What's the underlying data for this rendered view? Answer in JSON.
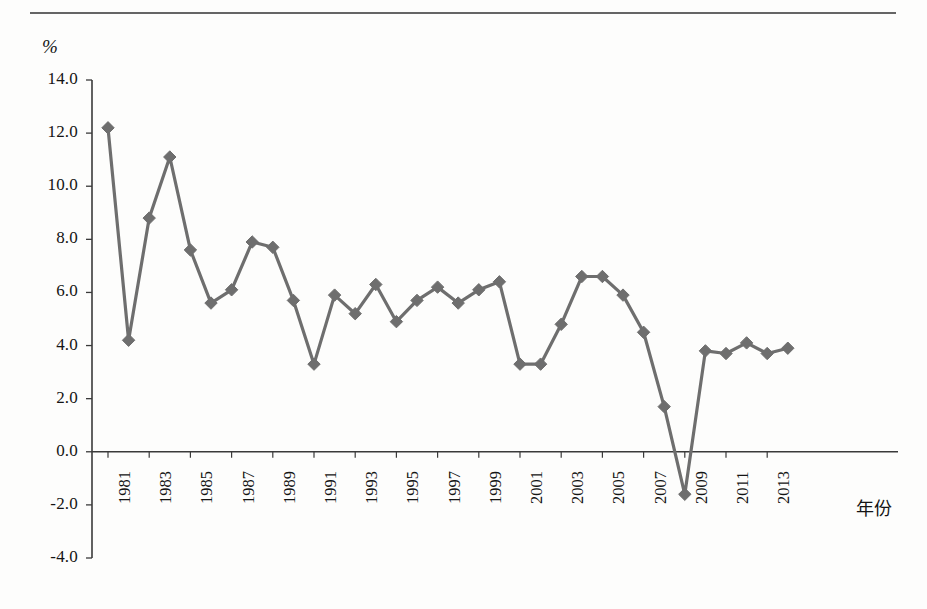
{
  "figure": {
    "y_axis_unit_label": "%",
    "x_axis_title": "年份",
    "axis_color": "#3a3a3a",
    "series_color": "#6e6e6e",
    "background": "#fdfdfc"
  },
  "chart_data": {
    "type": "line",
    "title": "",
    "xlabel": "年份",
    "ylabel": "%",
    "ylim": [
      -4.0,
      14.0
    ],
    "ytick_step": 2.0,
    "yticks": [
      "14.0",
      "12.0",
      "10.0",
      "8.0",
      "6.0",
      "4.0",
      "2.0",
      "0.0",
      "-2.0",
      "-4.0"
    ],
    "ytick_values": [
      14.0,
      12.0,
      10.0,
      8.0,
      6.0,
      4.0,
      2.0,
      0.0,
      -2.0,
      -4.0
    ],
    "grid": false,
    "legend": "none",
    "marker": "diamond",
    "xtick_labels": [
      "1981",
      "1983",
      "1985",
      "1987",
      "1989",
      "1991",
      "1993",
      "1995",
      "1997",
      "1999",
      "2001",
      "2003",
      "2005",
      "2007",
      "2009",
      "2011",
      "2013"
    ],
    "x": [
      1981,
      1982,
      1983,
      1984,
      1985,
      1986,
      1987,
      1988,
      1989,
      1990,
      1991,
      1992,
      1993,
      1994,
      1995,
      1996,
      1997,
      1998,
      1999,
      2000,
      2001,
      2002,
      2003,
      2004,
      2005,
      2006,
      2007,
      2008,
      2009,
      2010,
      2011,
      2012,
      2013,
      2014
    ],
    "values": [
      12.2,
      4.2,
      8.8,
      11.1,
      7.6,
      5.6,
      6.1,
      7.9,
      7.7,
      5.7,
      3.3,
      5.9,
      5.2,
      6.3,
      4.9,
      5.7,
      6.2,
      5.6,
      6.1,
      6.4,
      3.3,
      3.3,
      4.8,
      6.6,
      6.6,
      5.9,
      4.5,
      1.7,
      -1.6,
      3.8,
      3.7,
      4.1,
      3.7,
      3.9
    ],
    "series": [
      {
        "name": "",
        "values": [
          12.2,
          4.2,
          8.8,
          11.1,
          7.6,
          5.6,
          6.1,
          7.9,
          7.7,
          5.7,
          3.3,
          5.9,
          5.2,
          6.3,
          4.9,
          5.7,
          6.2,
          5.6,
          6.1,
          6.4,
          3.3,
          3.3,
          4.8,
          6.6,
          6.6,
          5.9,
          4.5,
          1.7,
          -1.6,
          3.8,
          3.7,
          4.1,
          3.7,
          3.9
        ]
      }
    ]
  }
}
